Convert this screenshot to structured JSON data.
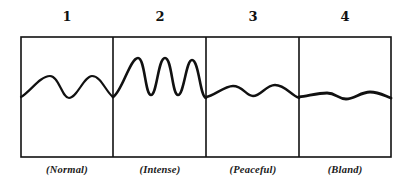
{
  "figure": {
    "panels": [
      {
        "number": "1",
        "label": "(Normal)",
        "center_x": 67,
        "wave": "M21,97 C30,92 40,76 50,76 C59,76 62,98 69,98 C77,98 84,76 92,76 C101,76 106,92 113,97"
      },
      {
        "number": "2",
        "label": "(Intense)",
        "center_x": 160,
        "wave": "M113,97 C122,92 130,58 138,58 C145,58 145,95 151,95 C157,95 158,58 165,58 C172,58 172,95 178,95 C184,95 186,60 192,60 C199,60 200,97 206,98"
      },
      {
        "number": "3",
        "label": "(Peaceful)",
        "center_x": 253,
        "wave": "M206,97 C214,96 224,86 233,86 C243,86 246,96 253,96 C261,96 266,85 275,85 C285,85 291,95 299,98"
      },
      {
        "number": "4",
        "label": "(Bland)",
        "center_x": 345,
        "wave": "M299,97 C308,96 318,93 327,93 C336,93 338,99 346,99 C354,99 361,92 370,92 C379,92 385,96 391,98"
      }
    ],
    "frame": {
      "left": 21,
      "top": 37,
      "right": 391,
      "bottom": 157,
      "dividers": [
        113,
        206,
        299
      ]
    },
    "colors": {
      "ink": "#111111",
      "background": "#ffffff"
    }
  }
}
